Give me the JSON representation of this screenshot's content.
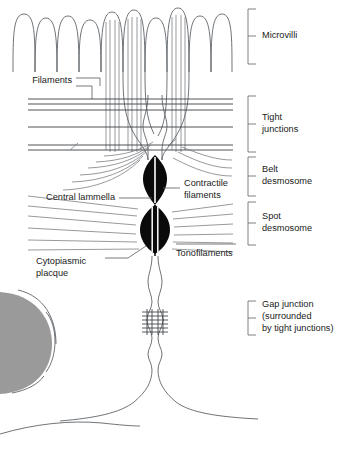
{
  "figure": {
    "background_color": "#ffffff",
    "ink_color": "#555a5e",
    "solid_color": "#0a0a0a",
    "nucleus_color": "#9a9a9a",
    "width": 358,
    "height": 451
  },
  "bracket_labels": [
    {
      "id": "microvilli",
      "line1": "Microvilli",
      "line2": "",
      "line3": ""
    },
    {
      "id": "tight-junctions",
      "line1": "Tight",
      "line2": "junctions",
      "line3": ""
    },
    {
      "id": "belt-desmosome",
      "line1": "Belt",
      "line2": "desmosome",
      "line3": ""
    },
    {
      "id": "spot-desmosome",
      "line1": "Spot",
      "line2": "desmosome",
      "line3": ""
    },
    {
      "id": "gap-junction",
      "line1": "Gap junction",
      "line2": "(surrounded",
      "line3": "by tight junctions)"
    }
  ],
  "leader_labels": [
    {
      "id": "filaments",
      "line1": "Filaments",
      "line2": ""
    },
    {
      "id": "central-lammella",
      "line1": "Central lammella",
      "line2": ""
    },
    {
      "id": "cytoplasmic-placque",
      "line1": "Cytopiasmic",
      "line2": "placque"
    },
    {
      "id": "contractile-filaments",
      "line1": "Contractile",
      "line2": "filaments"
    },
    {
      "id": "tonofilaments",
      "line1": "Tonofilaments",
      "line2": ""
    }
  ],
  "structures": {
    "microvilli_count": 10,
    "tight_junction_line_count": 5,
    "gap_junction_hatch_count": 7,
    "belt_desmosome": "dark lens with white central lamella",
    "spot_desmosome": "dark oval with central dense line and white flanking gaps",
    "nucleus": "gray half ellipse at left basal region"
  }
}
